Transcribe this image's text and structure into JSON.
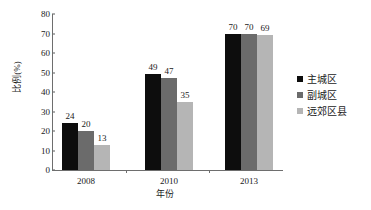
{
  "chart_data": {
    "type": "bar",
    "title": "",
    "xlabel": "年份",
    "ylabel": "比例(%)",
    "categories": [
      "2008",
      "2010",
      "2013"
    ],
    "series": [
      {
        "name": "主城区",
        "color": "#0d0d0d",
        "values": [
          24,
          49,
          70
        ]
      },
      {
        "name": "副城区",
        "color": "#6b6b6b",
        "values": [
          20,
          47,
          70
        ]
      },
      {
        "name": "远郊区县",
        "color": "#b5b5b5",
        "values": [
          13,
          35,
          69
        ]
      }
    ],
    "ylim": [
      0,
      80
    ],
    "ytick_step": 10,
    "yticks": [
      "0",
      "10",
      "20",
      "30",
      "40",
      "50",
      "60",
      "70",
      "80"
    ],
    "grid": false,
    "legend_position": "right"
  },
  "axes": {
    "y_title": "比例(%)",
    "x_title": "年份",
    "y_ticks": [
      "80",
      "70",
      "60",
      "50",
      "40",
      "30",
      "20",
      "10",
      "0"
    ],
    "x_ticks": [
      "2008",
      "2010",
      "2013"
    ]
  },
  "legend": {
    "items": [
      {
        "label": "主城区",
        "color": "#0d0d0d"
      },
      {
        "label": "副城区",
        "color": "#6b6b6b"
      },
      {
        "label": "远郊区县",
        "color": "#b5b5b5"
      }
    ]
  },
  "bar_labels": {
    "g0": [
      "24",
      "20",
      "13"
    ],
    "g1": [
      "49",
      "47",
      "35"
    ],
    "g2": [
      "70",
      "70",
      "69"
    ]
  },
  "colors": {
    "axis": "#6e6e6e",
    "text": "#1a1a1a",
    "background": "#ffffff"
  }
}
